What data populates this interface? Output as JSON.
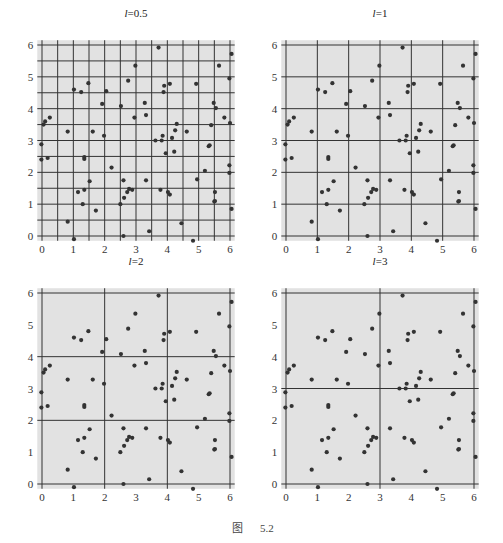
{
  "caption": {
    "prefix": "图",
    "number": "5.2"
  },
  "chart_data": {
    "type": "scatter",
    "title": "",
    "xlabel": "",
    "ylabel": "",
    "xlim": [
      -0.15,
      6.15
    ],
    "ylim": [
      -0.15,
      6.15
    ],
    "xticks": [
      "0",
      "1",
      "2",
      "3",
      "4",
      "5",
      "6"
    ],
    "yticks": [
      "0",
      "1",
      "2",
      "3",
      "4",
      "5",
      "6"
    ],
    "panels": [
      {
        "title_var": "l",
        "title_eq": "=",
        "title_val": "0.5",
        "grid_step": 0.5
      },
      {
        "title_var": "l",
        "title_eq": "=",
        "title_val": "1",
        "grid_step": 1
      },
      {
        "title_var": "l",
        "title_eq": "=",
        "title_val": "2",
        "grid_step": 2
      },
      {
        "title_var": "l",
        "title_eq": "=",
        "title_val": "3",
        "grid_step": 3
      }
    ],
    "points": [
      [
        3.72,
        5.92
      ],
      [
        6.05,
        5.72
      ],
      [
        5.65,
        5.35
      ],
      [
        2.98,
        5.35
      ],
      [
        5.98,
        4.95
      ],
      [
        2.75,
        4.88
      ],
      [
        4.92,
        4.78
      ],
      [
        4.08,
        4.78
      ],
      [
        3.9,
        4.72
      ],
      [
        1.48,
        4.8
      ],
      [
        1.02,
        4.6
      ],
      [
        1.25,
        4.52
      ],
      [
        2.05,
        4.55
      ],
      [
        3.88,
        4.52
      ],
      [
        1.92,
        4.15
      ],
      [
        2.52,
        4.08
      ],
      [
        3.28,
        4.18
      ],
      [
        5.48,
        4.18
      ],
      [
        5.55,
        4.02
      ],
      [
        0.25,
        3.72
      ],
      [
        0.1,
        3.6
      ],
      [
        0.05,
        3.5
      ],
      [
        2.95,
        3.72
      ],
      [
        3.32,
        3.8
      ],
      [
        5.82,
        3.72
      ],
      [
        6.0,
        3.55
      ],
      [
        4.3,
        3.52
      ],
      [
        5.4,
        3.48
      ],
      [
        0.82,
        3.28
      ],
      [
        1.62,
        3.28
      ],
      [
        4.25,
        3.32
      ],
      [
        4.62,
        3.28
      ],
      [
        1.98,
        3.15
      ],
      [
        3.85,
        3.15
      ],
      [
        4.15,
        3.08
      ],
      [
        3.62,
        3.0
      ],
      [
        3.82,
        3.0
      ],
      [
        -0.02,
        2.88
      ],
      [
        5.32,
        2.82
      ],
      [
        5.35,
        2.85
      ],
      [
        4.22,
        2.65
      ],
      [
        3.95,
        2.6
      ],
      [
        1.35,
        2.48
      ],
      [
        1.35,
        2.42
      ],
      [
        0.18,
        2.45
      ],
      [
        -0.02,
        2.4
      ],
      [
        5.98,
        2.22
      ],
      [
        2.22,
        2.15
      ],
      [
        5.2,
        2.05
      ],
      [
        5.98,
        1.98
      ],
      [
        4.95,
        1.78
      ],
      [
        1.52,
        1.72
      ],
      [
        2.6,
        1.75
      ],
      [
        3.32,
        1.75
      ],
      [
        2.78,
        1.48
      ],
      [
        2.88,
        1.45
      ],
      [
        3.78,
        1.45
      ],
      [
        1.35,
        1.45
      ],
      [
        2.72,
        1.38
      ],
      [
        1.15,
        1.38
      ],
      [
        4.02,
        1.38
      ],
      [
        4.08,
        1.3
      ],
      [
        5.52,
        1.38
      ],
      [
        2.62,
        1.2
      ],
      [
        5.5,
        1.08
      ],
      [
        5.52,
        1.1
      ],
      [
        1.3,
        1.0
      ],
      [
        2.5,
        1.0
      ],
      [
        1.72,
        0.8
      ],
      [
        6.05,
        0.85
      ],
      [
        0.82,
        0.45
      ],
      [
        4.45,
        0.4
      ],
      [
        3.42,
        0.15
      ],
      [
        2.6,
        0.0
      ],
      [
        1.02,
        -0.1
      ],
      [
        4.82,
        -0.15
      ]
    ],
    "colors": {
      "background": "#e2e2e2",
      "grid": "#333333",
      "point": "#333333"
    }
  }
}
